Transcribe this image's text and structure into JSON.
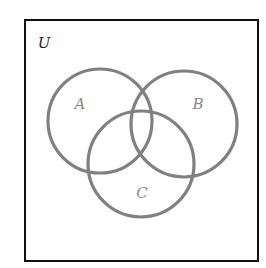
{
  "diagram": {
    "type": "venn",
    "universe": {
      "label": "U",
      "x": 25,
      "y": 20,
      "width": 233,
      "height": 241,
      "stroke": "#111111",
      "label_x": 44,
      "label_y": 48
    },
    "circle_stroke": "#808080",
    "circle_label_color": "#808080",
    "sets": [
      {
        "label": "A",
        "cx": 100,
        "cy": 121,
        "r": 52,
        "label_x": 80,
        "label_y": 109
      },
      {
        "label": "B",
        "cx": 184,
        "cy": 124,
        "r": 53,
        "label_x": 198,
        "label_y": 109
      },
      {
        "label": "C",
        "cx": 141,
        "cy": 164,
        "r": 53,
        "label_x": 142,
        "label_y": 198
      }
    ]
  }
}
